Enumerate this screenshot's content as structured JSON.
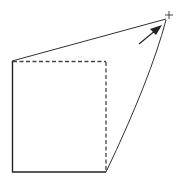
{
  "diagram": {
    "colors": {
      "stroke": "#222222",
      "background": "#ffffff"
    },
    "square": {
      "top_left": [
        12,
        61
      ],
      "top_right": [
        106,
        61
      ],
      "bottom_right": [
        106,
        172
      ],
      "bottom_left": [
        12,
        172
      ]
    },
    "vanishing_point": [
      169,
      15
    ],
    "arrow": {
      "from": [
        139,
        44
      ],
      "to": [
        161,
        26
      ]
    }
  }
}
